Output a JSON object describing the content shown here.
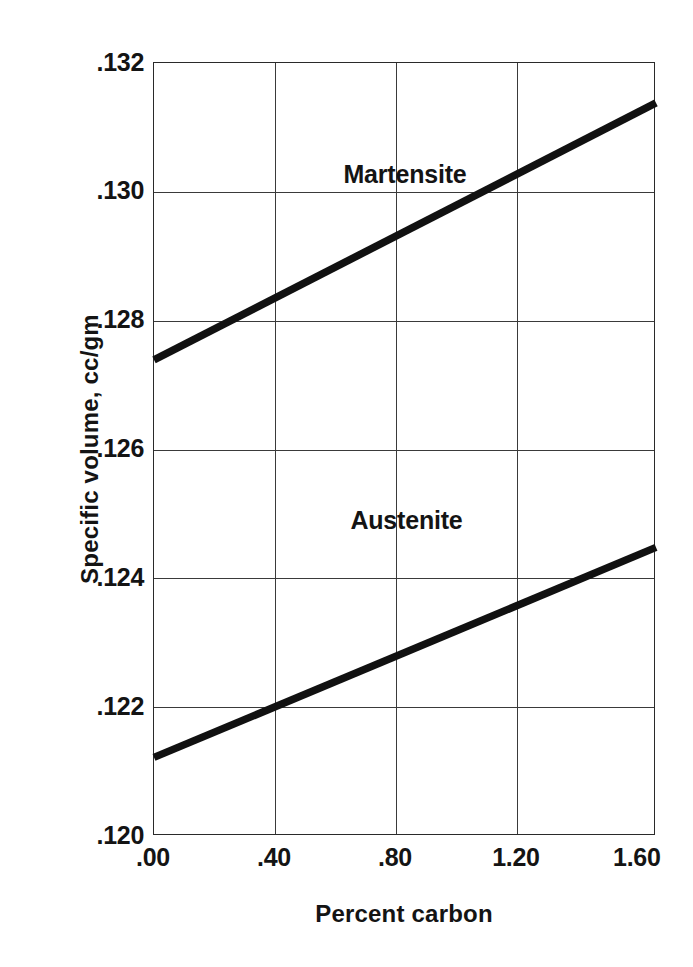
{
  "chart_data": {
    "type": "line",
    "title": "",
    "xlabel": "Percent carbon",
    "ylabel": "Specific volume, cc/gm",
    "xlim": [
      0.0,
      1.66
    ],
    "ylim": [
      0.12,
      0.132
    ],
    "grid": true,
    "legend_position": "inline-annotations",
    "x_ticks": [
      {
        "value": 0.0,
        "label": ".00"
      },
      {
        "value": 0.4,
        "label": ".40"
      },
      {
        "value": 0.8,
        "label": ".80"
      },
      {
        "value": 1.2,
        "label": "1.20"
      },
      {
        "value": 1.6,
        "label": "1.60"
      }
    ],
    "y_ticks": [
      {
        "value": 0.132,
        "label": ".132"
      },
      {
        "value": 0.13,
        "label": ".130"
      },
      {
        "value": 0.128,
        "label": ".128"
      },
      {
        "value": 0.126,
        "label": ".126"
      },
      {
        "value": 0.124,
        "label": ".124"
      },
      {
        "value": 0.122,
        "label": ".122"
      },
      {
        "value": 0.12,
        "label": ".120"
      }
    ],
    "x_gridlines": [
      0.4,
      0.8,
      1.2
    ],
    "y_gridlines": [
      0.13,
      0.128,
      0.126,
      0.124,
      0.122
    ],
    "series": [
      {
        "name": "Martensite",
        "color": "#111111",
        "x": [
          0.0,
          1.66
        ],
        "values": [
          0.12739,
          0.13138
        ],
        "label_x": 0.83,
        "label_y": 0.13028
      },
      {
        "name": "Austenite",
        "color": "#111111",
        "x": [
          0.0,
          1.66
        ],
        "values": [
          0.12122,
          0.12448
        ],
        "label_x": 0.835,
        "label_y": 0.1249
      }
    ],
    "annotations": [
      {
        "text": "Martensite",
        "x": 0.83,
        "y": 0.13028
      },
      {
        "text": "Austenite",
        "x": 0.835,
        "y": 0.1249
      }
    ],
    "colors": {
      "line": "#111111",
      "grid": "#3a3a3a",
      "frame": "#2a2a2a",
      "background": "#ffffff",
      "text": "#141414"
    }
  }
}
